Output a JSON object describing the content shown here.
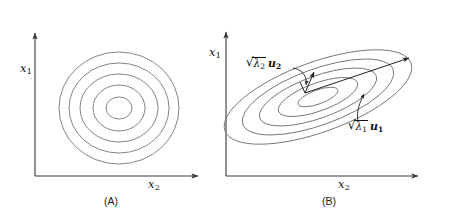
{
  "figure": {
    "background_color": "#ffffff",
    "stroke_color": "#6e6e6e",
    "axis_color": "#3a3a3a",
    "arrow_color": "#1f1f1f",
    "width": 450,
    "height": 218
  },
  "panels": [
    {
      "id": "A",
      "caption": "(A)",
      "caption_x": 104,
      "caption_y": 196,
      "axes": {
        "y_axis": {
          "x": 35,
          "y_top": 31,
          "y_bottom": 176
        },
        "x_axis": {
          "y": 176,
          "x_left": 35,
          "x_right": 200
        },
        "y_label": {
          "base": "x",
          "sub": "1",
          "x": 20,
          "y": 69
        },
        "x_label": {
          "base": "x",
          "sub": "2",
          "x": 148,
          "y": 182
        }
      },
      "contours": {
        "center_x": 119,
        "center_y": 108,
        "rotation_deg": 0,
        "rings": [
          {
            "rx": 13,
            "ry": 11
          },
          {
            "rx": 26,
            "ry": 23
          },
          {
            "rx": 39,
            "ry": 34
          },
          {
            "rx": 50,
            "ry": 45
          },
          {
            "rx": 60,
            "ry": 56
          }
        ]
      }
    },
    {
      "id": "B",
      "caption": "(B)",
      "caption_x": 322,
      "caption_y": 196,
      "axes": {
        "y_axis": {
          "x": 226,
          "y_top": 30,
          "y_bottom": 176
        },
        "x_axis": {
          "y": 176,
          "x_left": 226,
          "x_right": 420
        },
        "y_label": {
          "base": "x",
          "sub": "1",
          "x": 209,
          "y": 52
        },
        "x_label": {
          "base": "x",
          "sub": "2",
          "x": 338,
          "y": 182
        }
      },
      "contours": {
        "center_x": 318,
        "center_y": 97,
        "rotation_deg": -20,
        "rings": [
          {
            "rx": 21,
            "ry": 7
          },
          {
            "rx": 42,
            "ry": 14
          },
          {
            "rx": 62,
            "ry": 21
          },
          {
            "rx": 80,
            "ry": 28
          },
          {
            "rx": 99,
            "ry": 35
          }
        ]
      },
      "vectors": [
        {
          "name": "major-eigenvector",
          "from_x": 305,
          "from_y": 93,
          "to_x": 411,
          "to_y": 57,
          "label": {
            "radical": "λ",
            "radical_sub": "1",
            "vec": "u",
            "vec_sub": "1"
          },
          "label_x": 351,
          "label_y": 126,
          "leader": "M 360 122 C 358 112 362 104 365 96"
        },
        {
          "name": "minor-eigenvector",
          "from_x": 305,
          "from_y": 93,
          "to_x": 315,
          "to_y": 70,
          "label": {
            "radical": "λ",
            "radical_sub": "2",
            "vec": "u",
            "vec_sub": "2"
          },
          "label_x": 248,
          "label_y": 62,
          "leader": "M 296 69 C 303 70 308 76 307 83"
        }
      ]
    }
  ]
}
